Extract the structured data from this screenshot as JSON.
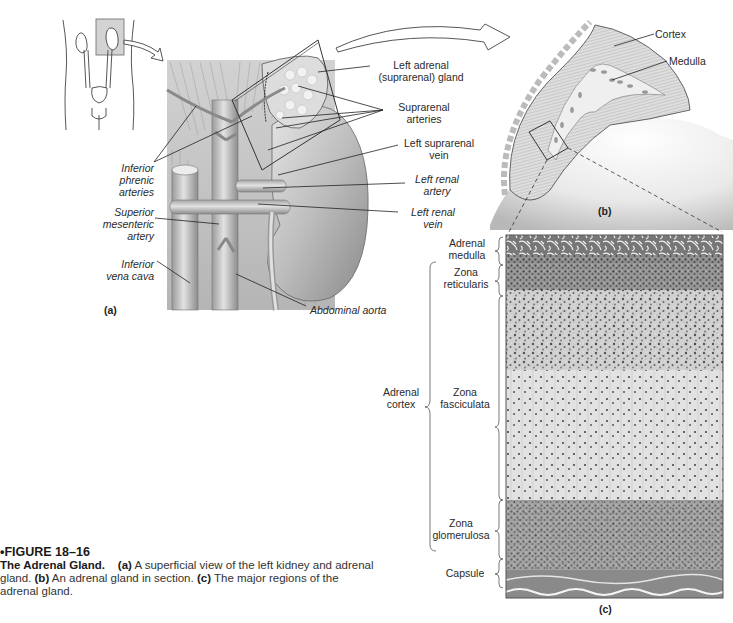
{
  "figure": {
    "number": "•FIGURE 18–16",
    "title": "The Adrenal Gland.",
    "caption_parts": [
      {
        "label": "(a)",
        "text": " A superficial view of the left kidney and adrenal gland. "
      },
      {
        "label": "(b)",
        "text": " An adrenal gland in section. "
      },
      {
        "label": "(c)",
        "text": " The major regions of the adrenal gland."
      }
    ]
  },
  "panel_a": {
    "letter": "(a)",
    "labels_left": {
      "inferior_phrenic": [
        "Inferior",
        "phrenic",
        "arteries"
      ],
      "superior_mesenteric": [
        "Superior",
        "mesenteric",
        "artery"
      ],
      "inferior_vena_cava": [
        "Inferior",
        "vena cava"
      ]
    },
    "labels_right": {
      "left_adrenal_gland": [
        "Left adrenal",
        "(suprarenal) gland"
      ],
      "suprarenal_arteries": [
        "Suprarenal",
        "arteries"
      ],
      "left_suprarenal_vein": [
        "Left suprarenal",
        "vein"
      ],
      "left_renal_artery": [
        "Left renal",
        "artery"
      ],
      "left_renal_vein": [
        "Left renal",
        "vein"
      ],
      "abdominal_aorta": "Abdominal aorta"
    }
  },
  "panel_b": {
    "letter": "(b)",
    "labels": {
      "cortex": "Cortex",
      "medulla": "Medulla"
    }
  },
  "panel_c": {
    "letter": "(c)",
    "zones": {
      "adrenal_medulla": [
        "Adrenal",
        "medulla"
      ],
      "zona_reticularis": [
        "Zona",
        "reticularis"
      ],
      "zona_fasciculata": [
        "Zona",
        "fasciculata"
      ],
      "zona_glomerulosa": [
        "Zona",
        "glomerulosa"
      ],
      "capsule": "Capsule"
    },
    "group_label": [
      "Adrenal",
      "cortex"
    ]
  }
}
